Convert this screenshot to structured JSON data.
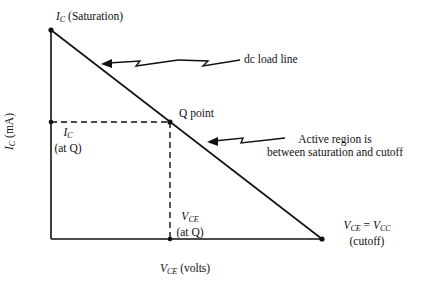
{
  "diagram": {
    "colors": {
      "line": "#111111",
      "background": "#ffffff"
    },
    "saturation": {
      "var": "I",
      "sub": "C",
      "text": "(Saturation)"
    },
    "load_line_label": "dc load line",
    "q_point_label": "Q point",
    "active_region_label": [
      "Active region is",
      "between saturation and cutoff"
    ],
    "ic_at_q": {
      "var": "I",
      "sub": "C",
      "text": "(at Q)"
    },
    "vce_at_q": {
      "var": "V",
      "sub": "CE",
      "text": "(at Q)"
    },
    "cutoff": {
      "var1": "V",
      "sub1": "CE",
      "eq": " = ",
      "var2": "V",
      "sub2": "CC",
      "text": "(cutoff)"
    },
    "y_axis": {
      "var": "I",
      "sub": "C",
      "text": " (mA)"
    },
    "x_axis": {
      "var": "V",
      "sub": "CE",
      "text": " (volts)"
    }
  }
}
